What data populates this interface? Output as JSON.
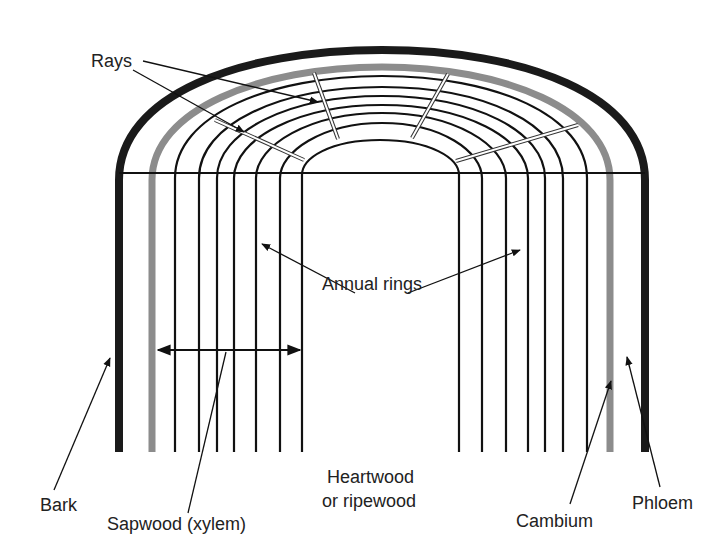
{
  "figure": {
    "colors": {
      "bark": "#1a1a1a",
      "cambium": "#8c8c8c",
      "rings": "#111111",
      "ray_fill": "#ffffff",
      "text": "#222222"
    },
    "labels": {
      "rays": "Rays",
      "annual_rings": "Annual rings",
      "bark": "Bark",
      "sapwood": "Sapwood (xylem)",
      "heartwood_line1": "Heartwood",
      "heartwood_line2": "or ripewood",
      "cambium": "Cambium",
      "phloem": "Phloem"
    },
    "structure": {
      "annual_ring_count_per_side": 7,
      "ray_count": 4
    }
  }
}
